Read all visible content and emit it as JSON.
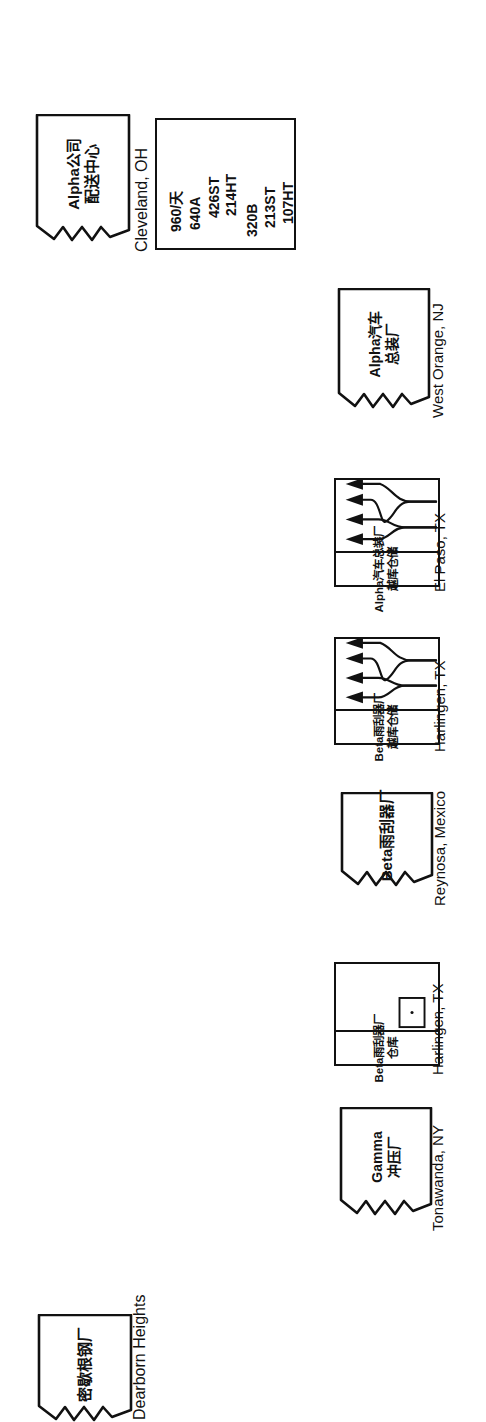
{
  "diagram": {
    "orientation": "rotated-90-ccw",
    "stroke_color": "#111111",
    "background_color": "#ffffff"
  },
  "nodes": [
    {
      "id": "alpha-dc",
      "kind": "factory",
      "name_lines": [
        "Alpha公司",
        "配送中心"
      ],
      "location": "Cleveland, OH"
    },
    {
      "id": "alpha-assembly",
      "kind": "factory",
      "name_lines": [
        "Alpha汽车",
        "总装厂"
      ],
      "location": "West Orange, NJ"
    },
    {
      "id": "alpha-crossdock",
      "kind": "crossdock",
      "name_lines": [
        "Alpha汽车总装厂",
        "越库仓储"
      ],
      "location": "El Paso, TX"
    },
    {
      "id": "beta-crossdock",
      "kind": "crossdock",
      "name_lines": [
        "Beta雨刮器厂",
        "越库仓储"
      ],
      "location": "Harlingen, TX"
    },
    {
      "id": "beta-plant",
      "kind": "factory",
      "name_lines": [
        "Beta雨刮器厂"
      ],
      "location": "Reynosa, Mexico"
    },
    {
      "id": "beta-warehouse",
      "kind": "warehouse",
      "name_lines": [
        "Beta雨刮器厂",
        "仓库"
      ],
      "location": "Harlingen, TX"
    },
    {
      "id": "gamma-stamping",
      "kind": "factory",
      "name_lines": [
        "Gamma",
        "冲压厂"
      ],
      "location": "Tonawanda, NY"
    },
    {
      "id": "michigan-steel",
      "kind": "factory",
      "name_lines": [
        "密歇根钢厂"
      ],
      "location": "Dearborn Heights"
    }
  ],
  "data_box": {
    "owner": "alpha-dc",
    "group_1": [
      "960/天",
      "640A",
      "426ST",
      "214HT"
    ],
    "group_2": [
      "320B",
      "213ST",
      "107HT"
    ]
  }
}
